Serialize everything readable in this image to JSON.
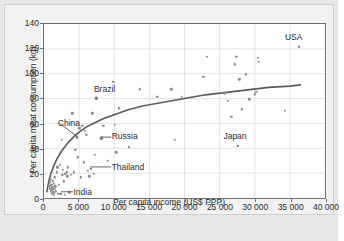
{
  "chart_data": {
    "type": "scatter",
    "title": "",
    "xlabel": "Per capita income (US$ PPP)",
    "ylabel": "Per capita meat consumption (kg)",
    "xlim": [
      0,
      40000
    ],
    "ylim": [
      0,
      140
    ],
    "xticks": [
      0,
      5000,
      10000,
      15000,
      20000,
      25000,
      30000,
      35000,
      40000
    ],
    "xtick_labels": [
      "0",
      "5 000",
      "10 000",
      "15 000",
      "20 000",
      "25 000",
      "30 000",
      "35 000",
      "40 000"
    ],
    "yticks": [
      0,
      20,
      40,
      60,
      80,
      100,
      120,
      140
    ],
    "ytick_labels": [
      "0",
      "20",
      "40",
      "60",
      "80",
      "100",
      "120",
      "140"
    ],
    "grid": true,
    "legend": "none",
    "point_color": "#8c8c8c",
    "trend_color": "#5a5a5a",
    "axis_color": "#6f6f6f",
    "plot_background": "#ffffff",
    "figure_background": "#f2f2f2",
    "annotations": [
      {
        "label": "USA",
        "label_x": 34200,
        "label_y": 128,
        "point_x": 36000,
        "point_y": 122,
        "leader": false
      },
      {
        "label": "Brazil",
        "label_x": 7200,
        "label_y": 87,
        "point_x": 7400,
        "point_y": 81,
        "leader": false
      },
      {
        "label": "China",
        "label_x": 2100,
        "label_y": 60,
        "point_x": 4600,
        "point_y": 50,
        "leader": true
      },
      {
        "label": "Russia",
        "label_x": 9700,
        "label_y": 49,
        "point_x": 8100,
        "point_y": 49,
        "leader": true
      },
      {
        "label": "Thailand",
        "label_x": 9700,
        "label_y": 25,
        "point_x": 6600,
        "point_y": 25,
        "leader": true
      },
      {
        "label": "Japan",
        "label_x": 25500,
        "label_y": 49,
        "point_x": 27400,
        "point_y": 43,
        "leader": false
      },
      {
        "label": "India",
        "label_x": 4300,
        "label_y": 5,
        "point_x": 2400,
        "point_y": 5,
        "leader": true
      }
    ],
    "points": [
      [
        800,
        14
      ],
      [
        850,
        11
      ],
      [
        900,
        9
      ],
      [
        950,
        16
      ],
      [
        1000,
        7
      ],
      [
        1050,
        12
      ],
      [
        1100,
        5
      ],
      [
        1150,
        10
      ],
      [
        1200,
        8
      ],
      [
        1250,
        15
      ],
      [
        1300,
        6
      ],
      [
        1350,
        13
      ],
      [
        1400,
        4
      ],
      [
        1450,
        9
      ],
      [
        1500,
        18
      ],
      [
        1600,
        11
      ],
      [
        1700,
        7
      ],
      [
        1800,
        22
      ],
      [
        1900,
        26
      ],
      [
        2000,
        5
      ],
      [
        2100,
        12
      ],
      [
        2200,
        28
      ],
      [
        2400,
        5
      ],
      [
        2500,
        48
      ],
      [
        2600,
        20
      ],
      [
        2700,
        24
      ],
      [
        2800,
        15
      ],
      [
        2900,
        4
      ],
      [
        3000,
        21
      ],
      [
        3100,
        43
      ],
      [
        3200,
        22
      ],
      [
        3300,
        19
      ],
      [
        3400,
        26
      ],
      [
        3600,
        6
      ],
      [
        3800,
        20
      ],
      [
        4000,
        69
      ],
      [
        4200,
        22
      ],
      [
        4400,
        40
      ],
      [
        4600,
        50
      ],
      [
        4800,
        34
      ],
      [
        5000,
        57
      ],
      [
        5200,
        18
      ],
      [
        5400,
        59
      ],
      [
        5600,
        30
      ],
      [
        5800,
        55
      ],
      [
        6000,
        52
      ],
      [
        6200,
        23
      ],
      [
        6400,
        19
      ],
      [
        6600,
        25
      ],
      [
        6800,
        69
      ],
      [
        7000,
        21
      ],
      [
        7200,
        36
      ],
      [
        7400,
        81
      ],
      [
        8100,
        49
      ],
      [
        8400,
        59
      ],
      [
        9000,
        31
      ],
      [
        9800,
        94
      ],
      [
        10000,
        60
      ],
      [
        10200,
        38
      ],
      [
        10600,
        73
      ],
      [
        12000,
        42
      ],
      [
        13500,
        88
      ],
      [
        16000,
        82
      ],
      [
        18000,
        88
      ],
      [
        18500,
        48
      ],
      [
        19500,
        82
      ],
      [
        22500,
        98
      ],
      [
        23000,
        114
      ],
      [
        25500,
        85
      ],
      [
        26000,
        79
      ],
      [
        26500,
        66
      ],
      [
        27000,
        108
      ],
      [
        27200,
        114
      ],
      [
        27400,
        43
      ],
      [
        27600,
        96
      ],
      [
        28000,
        72
      ],
      [
        28500,
        100
      ],
      [
        29000,
        80
      ],
      [
        29800,
        84
      ],
      [
        30000,
        86
      ],
      [
        30200,
        113
      ],
      [
        30400,
        110
      ],
      [
        34000,
        71
      ],
      [
        36000,
        122
      ]
    ],
    "trend_line": [
      [
        400,
        5
      ],
      [
        700,
        14
      ],
      [
        1000,
        20
      ],
      [
        1400,
        26
      ],
      [
        1800,
        31
      ],
      [
        2300,
        36
      ],
      [
        2800,
        40
      ],
      [
        3500,
        45
      ],
      [
        4200,
        49
      ],
      [
        5000,
        53
      ],
      [
        6000,
        57
      ],
      [
        7000,
        60
      ],
      [
        8500,
        64
      ],
      [
        10000,
        67
      ],
      [
        12000,
        71
      ],
      [
        14000,
        74
      ],
      [
        16000,
        76
      ],
      [
        18000,
        78
      ],
      [
        20000,
        80
      ],
      [
        23000,
        83
      ],
      [
        26000,
        85
      ],
      [
        29000,
        87
      ],
      [
        32000,
        89
      ],
      [
        35000,
        90
      ],
      [
        36500,
        91
      ]
    ]
  }
}
